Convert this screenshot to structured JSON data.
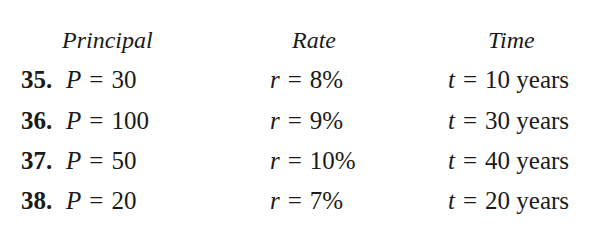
{
  "headers": {
    "principal": "Principal",
    "rate": "Rate",
    "time": "Time"
  },
  "rows": [
    {
      "number": "35.",
      "principal_var": "P",
      "principal_value": "30",
      "rate_var": "r",
      "rate_value": "8%",
      "time_var": "t",
      "time_value": "10 years"
    },
    {
      "number": "36.",
      "principal_var": "P",
      "principal_value": "100",
      "rate_var": "r",
      "rate_value": "9%",
      "time_var": "t",
      "time_value": "30 years"
    },
    {
      "number": "37.",
      "principal_var": "P",
      "principal_value": "50",
      "rate_var": "r",
      "rate_value": "10%",
      "time_var": "t",
      "time_value": "40 years"
    },
    {
      "number": "38.",
      "principal_var": "P",
      "principal_value": "20",
      "rate_var": "r",
      "rate_value": "7%",
      "time_var": "t",
      "time_value": "20 years"
    }
  ],
  "symbols": {
    "equals": "="
  }
}
